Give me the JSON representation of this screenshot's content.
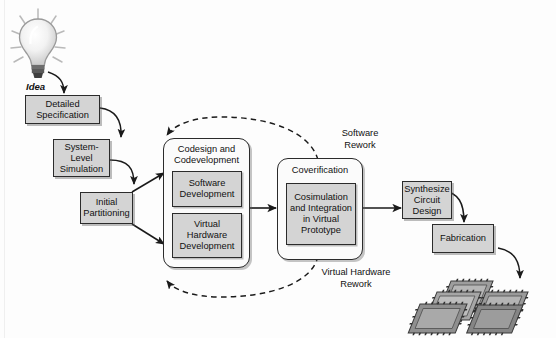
{
  "figure": {
    "caption": "",
    "background_color": "#fdfdfd",
    "box_fill": "#d4d4d4",
    "box_stroke": "#2b2b2b",
    "group_fill": "#fbfbfb"
  },
  "idea": {
    "label": "Idea",
    "icon": "lightbulb-icon"
  },
  "boxes": [
    {
      "id": "detailed-specification",
      "label": "Detailed\nSpecification"
    },
    {
      "id": "system-level-simulation",
      "label": "System-\nLevel\nSimulation"
    },
    {
      "id": "initial-partitioning",
      "label": "Initial\nPartitioning"
    },
    {
      "id": "synthesize-circuit-design",
      "label": "Synthesize\nCircuit\nDesign"
    },
    {
      "id": "fabrication",
      "label": "Fabrication"
    }
  ],
  "groups": [
    {
      "id": "codesign-codevelopment",
      "title": "Codesign and\nCodevelopment",
      "children": [
        {
          "id": "software-development",
          "label": "Software\nDevelopment"
        },
        {
          "id": "virtual-hardware-development",
          "label": "Virtual\nHardware\nDevelopment"
        }
      ]
    },
    {
      "id": "coverification",
      "title": "Coverification",
      "children": [
        {
          "id": "cosimulation-integration",
          "label": "Cosimulation\nand Integration\nin Virtual\nPrototype"
        }
      ]
    }
  ],
  "feedback_labels": [
    {
      "id": "software-rework",
      "label": "Software\nRework"
    },
    {
      "id": "virtual-hardware-rework",
      "label": "Virtual Hardware\nRework"
    }
  ],
  "chips": {
    "id": "fabricated-chips",
    "count": 5,
    "label": "integrated-circuit-chips"
  }
}
